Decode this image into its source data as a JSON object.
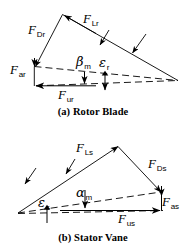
{
  "figure": {
    "type": "vector-force-diagram",
    "stroke_color": "#000000",
    "background_color": "#ffffff"
  },
  "panels": [
    {
      "id": "rotor",
      "caption": "(a) Rotor Blade",
      "labels": {
        "drag": {
          "base": "F",
          "sub": "Dr"
        },
        "lift": {
          "base": "F",
          "sub": "Lr"
        },
        "axial": {
          "base": "F",
          "sub": "ar"
        },
        "tangential": {
          "base": "F",
          "sub": "ur"
        },
        "angle_beta": {
          "base": "β",
          "sub": "m"
        },
        "angle_epsilon": {
          "base": "ε",
          "sub": "r"
        }
      }
    },
    {
      "id": "stator",
      "caption": "(b) Stator Vane",
      "labels": {
        "lift": {
          "base": "F",
          "sub": "Ls"
        },
        "drag": {
          "base": "F",
          "sub": "Ds"
        },
        "axial": {
          "base": "F",
          "sub": "as"
        },
        "tangential": {
          "base": "F",
          "sub": "us"
        },
        "angle_alpha": {
          "base": "α",
          "sub": "m"
        },
        "angle_epsilon": {
          "base": "ε",
          "sub": "s"
        }
      }
    }
  ]
}
